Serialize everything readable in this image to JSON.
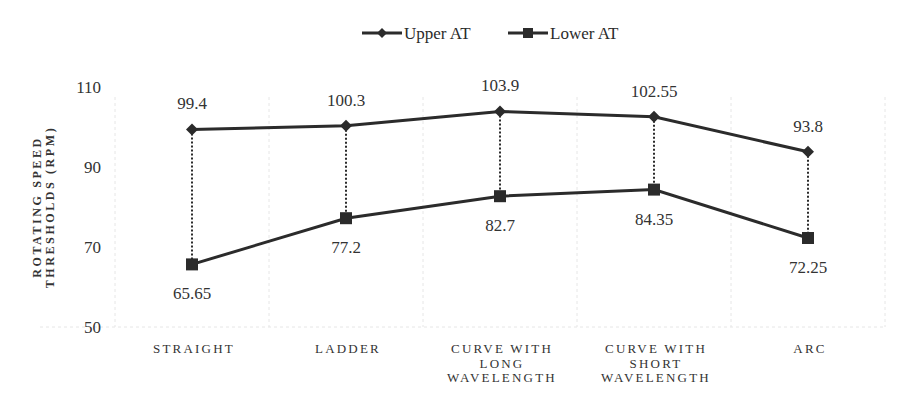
{
  "chart_data": {
    "type": "line",
    "title": "",
    "xlabel": "",
    "ylabel": "ROTATING SPEED THRESHOLDS (RPM)",
    "ylabel_lines": [
      "ROTATING SPEED",
      "THRESHOLDS (RPM)"
    ],
    "ylim": [
      50,
      110
    ],
    "yticks": [
      50,
      70,
      90,
      110
    ],
    "grid": true,
    "legend_position": "top-center",
    "categories": [
      "STRAIGHT",
      "LADDER",
      "CURVE WITH LONG WAVELENGTH",
      "CURVE WITH SHORT WAVELENGTH",
      "ARC"
    ],
    "category_lines": [
      [
        "STRAIGHT"
      ],
      [
        "LADDER"
      ],
      [
        "CURVE WITH",
        "LONG",
        "WAVELENGTH"
      ],
      [
        "CURVE WITH",
        "SHORT",
        "WAVELENGTH"
      ],
      [
        "ARC"
      ]
    ],
    "series": [
      {
        "name": "Upper AT",
        "marker": "diamond",
        "values": [
          99.4,
          100.3,
          103.9,
          102.55,
          93.8
        ],
        "labels": [
          "99.4",
          "100.3",
          "103.9",
          "102.55",
          "93.8"
        ],
        "label_position": "above"
      },
      {
        "name": "Lower AT",
        "marker": "square",
        "values": [
          65.65,
          77.2,
          82.7,
          84.35,
          72.25
        ],
        "labels": [
          "65.65",
          "77.2",
          "82.7",
          "84.35",
          "72.25"
        ],
        "label_position": "below"
      }
    ],
    "annotations": "Dotted vertical drop lines connect Upper AT and Lower AT at each category",
    "colors": {
      "line": "#2b2b2b",
      "grid": "#e6e6e6",
      "text": "#333333"
    }
  }
}
